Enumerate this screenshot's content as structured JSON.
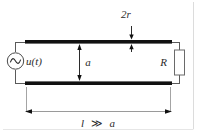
{
  "figure": {
    "labels": {
      "wire_diameter": "2r",
      "separation": "a",
      "resistor": "R",
      "source": "u(t)",
      "length_l": "l",
      "length_op": "≫",
      "length_a": "a"
    },
    "colors": {
      "conductor": "#111111",
      "wire": "#5a5a5a",
      "annotation": "#2b2b2b",
      "border": "#d8d8d8",
      "background": "#ffffff"
    },
    "icons": {
      "ac_source": "ac-source-icon",
      "resistor": "resistor-icon",
      "arrow_down": "arrow-down-icon",
      "arrow_updown": "arrow-up-down-icon",
      "arrow_leftright": "arrow-left-right-icon"
    },
    "geometry": {
      "top_conductor_y": 42,
      "bottom_conductor_y": 83,
      "conductor_left_x": 25,
      "conductor_right_x": 172,
      "dimension_line_y": 111
    }
  }
}
